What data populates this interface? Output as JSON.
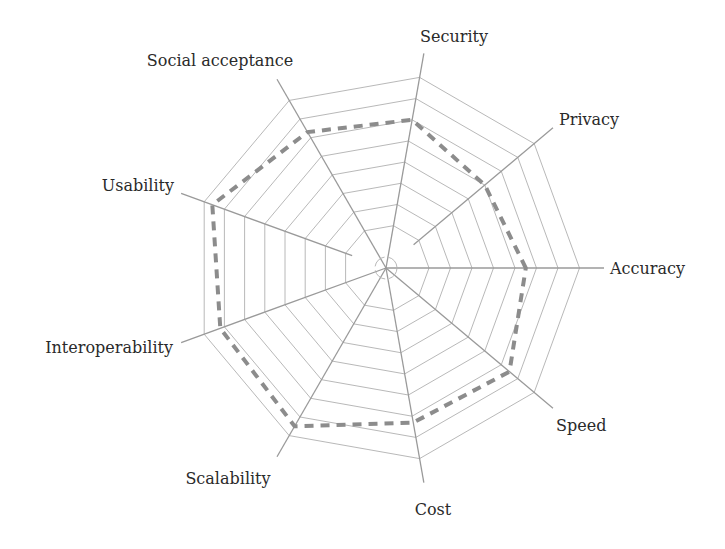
{
  "chart_data": {
    "type": "radar",
    "title": "",
    "categories": [
      "Accuracy",
      "Privacy",
      "Security",
      "Social acceptance",
      "Usability",
      "Interoperability",
      "Scalability",
      "Cost",
      "Speed"
    ],
    "axis_angles_deg": [
      0,
      40,
      80,
      120,
      160,
      200,
      240,
      280,
      320
    ],
    "series": [
      {
        "name": "Assessment",
        "style": "dashed",
        "color": "#8c8c8c",
        "values": [
          6.5,
          6.0,
          7.0,
          7.3,
          8.6,
          8.2,
          8.5,
          7.3,
          7.5
        ]
      }
    ],
    "scale": {
      "min": 0,
      "max": 9,
      "rings": 9,
      "tick_labels_shown": false
    },
    "grid": true,
    "legend": "none",
    "colors": {
      "grid": "#b0b0b0",
      "axis": "#9a9a9a",
      "series": "#8c8c8c",
      "label": "#2a2a2a"
    }
  }
}
